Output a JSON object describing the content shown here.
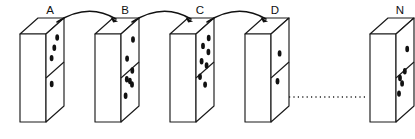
{
  "figure": {
    "background_color": "#ffffff",
    "ink_color": "#111111",
    "width": 415,
    "height": 139
  },
  "panels": [
    {
      "id": "a",
      "label": "A",
      "label_x": 50,
      "label_y": 14,
      "origin_x": 20,
      "origin_y": 18,
      "upper_dot_count": 3,
      "lower_dot_count": 1,
      "dots": [
        {
          "x": 0.62,
          "y": 0.16
        },
        {
          "x": 0.5,
          "y": 0.28
        },
        {
          "x": 0.4,
          "y": 0.4
        },
        {
          "x": 0.46,
          "y": 0.7
        }
      ]
    },
    {
      "id": "b",
      "label": "B",
      "label_x": 125,
      "label_y": 14,
      "origin_x": 95,
      "origin_y": 18,
      "upper_dot_count": 2,
      "lower_dot_count": 6,
      "dots": [
        {
          "x": 0.66,
          "y": 0.2
        },
        {
          "x": 0.38,
          "y": 0.42
        },
        {
          "x": 0.62,
          "y": 0.56
        },
        {
          "x": 0.4,
          "y": 0.66
        },
        {
          "x": 0.52,
          "y": 0.68
        },
        {
          "x": 0.6,
          "y": 0.72
        },
        {
          "x": 0.36,
          "y": 0.84
        }
      ]
    },
    {
      "id": "c",
      "label": "C",
      "label_x": 200,
      "label_y": 14,
      "origin_x": 170,
      "origin_y": 18,
      "upper_dot_count": 4,
      "lower_dot_count": 3,
      "dots": [
        {
          "x": 0.68,
          "y": 0.18
        },
        {
          "x": 0.44,
          "y": 0.28
        },
        {
          "x": 0.7,
          "y": 0.34
        },
        {
          "x": 0.42,
          "y": 0.46
        },
        {
          "x": 0.66,
          "y": 0.5
        },
        {
          "x": 0.4,
          "y": 0.64
        },
        {
          "x": 0.64,
          "y": 0.72
        }
      ]
    },
    {
      "id": "d",
      "label": "D",
      "label_x": 275,
      "label_y": 14,
      "origin_x": 245,
      "origin_y": 18,
      "upper_dot_count": 1,
      "lower_dot_count": 1,
      "dots": [
        {
          "x": 0.56,
          "y": 0.34
        },
        {
          "x": 0.5,
          "y": 0.66
        }
      ]
    },
    {
      "id": "n",
      "label": "N",
      "label_x": 400,
      "label_y": 14,
      "origin_x": 370,
      "origin_y": 18,
      "upper_dot_count": 1,
      "lower_dot_count": 4,
      "dots": [
        {
          "x": 0.62,
          "y": 0.3
        },
        {
          "x": 0.6,
          "y": 0.56
        },
        {
          "x": 0.44,
          "y": 0.64
        },
        {
          "x": 0.52,
          "y": 0.7
        },
        {
          "x": 0.46,
          "y": 0.82
        }
      ]
    }
  ],
  "geometry": {
    "face_width": 26,
    "face_height": 88,
    "depth_x": -18,
    "depth_y": 16,
    "slant": 10,
    "dot_rx": 1.9,
    "dot_ry": 3.2
  },
  "arrows": [
    {
      "id": "a-to-b",
      "from": "A",
      "to": "B",
      "start_x": 57,
      "start_y": 22,
      "end_x": 118,
      "end_y": 21,
      "ctrl_x": 88,
      "ctrl_y": 2
    },
    {
      "id": "b-to-c",
      "from": "B",
      "to": "C",
      "start_x": 132,
      "start_y": 22,
      "end_x": 193,
      "end_y": 21,
      "ctrl_x": 163,
      "ctrl_y": 2
    },
    {
      "id": "c-to-d",
      "from": "C",
      "to": "D",
      "start_x": 207,
      "start_y": 22,
      "end_x": 268,
      "end_y": 21,
      "ctrl_x": 238,
      "ctrl_y": 2
    }
  ],
  "connector": {
    "id": "d-to-n-ellipsis",
    "label": "dotted continuation",
    "start_x": 288,
    "end_x": 366,
    "y": 97
  }
}
